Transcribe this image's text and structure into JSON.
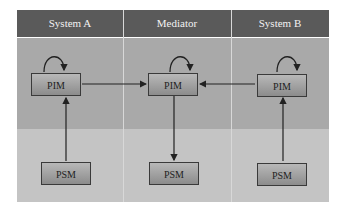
{
  "columns": [
    {
      "id": "system-a",
      "label": "System A"
    },
    {
      "id": "mediator",
      "label": "Mediator"
    },
    {
      "id": "system-b",
      "label": "System B"
    }
  ],
  "nodes": {
    "system_a_pim": "PIM",
    "system_a_psm": "PSM",
    "mediator_pim": "PIM",
    "mediator_psm": "PSM",
    "system_b_pim": "PIM",
    "system_b_psm": "PSM"
  },
  "edges": [
    {
      "from": "system_a_pim",
      "to": "system_a_pim",
      "type": "self-loop"
    },
    {
      "from": "mediator_pim",
      "to": "mediator_pim",
      "type": "self-loop"
    },
    {
      "from": "system_b_pim",
      "to": "system_b_pim",
      "type": "self-loop"
    },
    {
      "from": "system_a_psm",
      "to": "system_a_pim"
    },
    {
      "from": "system_a_pim",
      "to": "mediator_pim"
    },
    {
      "from": "system_b_pim",
      "to": "mediator_pim"
    },
    {
      "from": "mediator_pim",
      "to": "mediator_psm"
    },
    {
      "from": "system_b_psm",
      "to": "system_b_pim"
    }
  ],
  "colors": {
    "header": "#5a5a5a",
    "upper_band": "#a9a9a9",
    "lower_band": "#c4c4c4",
    "box_border": "#3a3a3a"
  }
}
